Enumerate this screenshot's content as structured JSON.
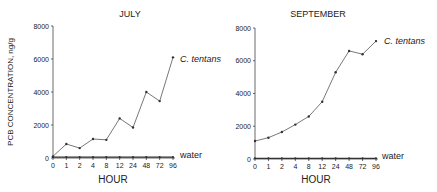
{
  "figure": {
    "ylabel": "PCB CONCENTRATION, ng/g",
    "xlabel": "HOUR"
  },
  "chart_data": [
    {
      "type": "line",
      "title": "JULY",
      "xlabel": "HOUR",
      "ylabel": "PCB CONCENTRATION, ng/g",
      "categories": [
        "0",
        "1",
        "2",
        "4",
        "8",
        "12",
        "24",
        "48",
        "72",
        "96"
      ],
      "yticks": [
        0,
        2000,
        4000,
        6000,
        8000
      ],
      "ylim": [
        0,
        8000
      ],
      "grid": false,
      "series": [
        {
          "name": "C. tentans",
          "values": [
            100,
            850,
            600,
            1150,
            1100,
            2400,
            1850,
            4000,
            3450,
            6100
          ]
        },
        {
          "name": "water",
          "values": [
            50,
            50,
            50,
            50,
            50,
            50,
            50,
            50,
            50,
            50
          ]
        }
      ]
    },
    {
      "type": "line",
      "title": "SEPTEMBER",
      "xlabel": "HOUR",
      "ylabel": "",
      "categories": [
        "0",
        "1",
        "2",
        "4",
        "8",
        "12",
        "24",
        "48",
        "72",
        "96"
      ],
      "yticks": [
        0,
        2000,
        4000,
        6000,
        8000
      ],
      "ylim": [
        0,
        8000
      ],
      "grid": false,
      "series": [
        {
          "name": "C. tentans",
          "values": [
            1100,
            1300,
            1650,
            2100,
            2600,
            3500,
            5300,
            6600,
            6400,
            7200
          ]
        },
        {
          "name": "water",
          "values": [
            40,
            40,
            40,
            40,
            40,
            40,
            40,
            40,
            40,
            40
          ]
        }
      ]
    }
  ]
}
